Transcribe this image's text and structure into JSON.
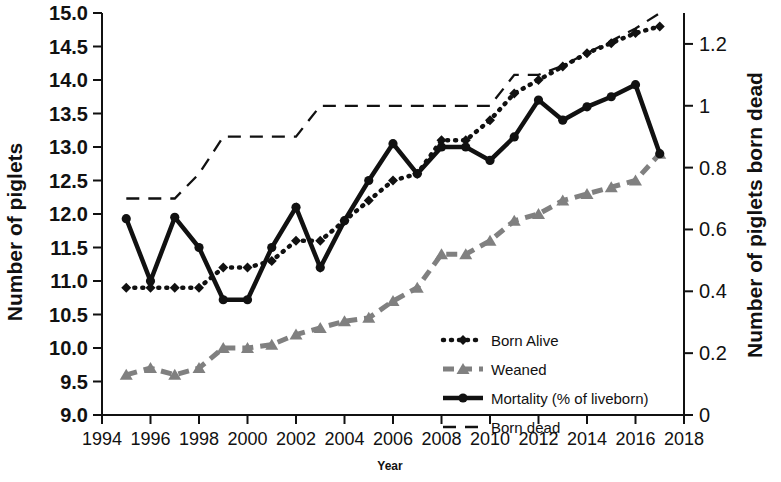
{
  "chart_data": {
    "type": "line",
    "title": "",
    "xlabel": "Year",
    "ylabel": "Number of piglets",
    "ylabel_right": "Number of piglets born dead",
    "x": [
      1995,
      1996,
      1997,
      1998,
      1999,
      2000,
      2001,
      2002,
      2003,
      2004,
      2005,
      2006,
      2007,
      2008,
      2009,
      2010,
      2011,
      2012,
      2013,
      2014,
      2015,
      2016,
      2017
    ],
    "xlim": [
      1994,
      2018
    ],
    "xticks": [
      "1994",
      "1996",
      "1998",
      "2000",
      "2002",
      "2004",
      "2006",
      "2008",
      "2010",
      "2012",
      "2014",
      "2016",
      "2018"
    ],
    "xtick_values": [
      1994,
      1996,
      1998,
      2000,
      2002,
      2004,
      2006,
      2008,
      2010,
      2012,
      2014,
      2016,
      2018
    ],
    "ylim": [
      9.0,
      15.0
    ],
    "yticks": [
      "9.0",
      "9.5",
      "10.0",
      "10.5",
      "11.0",
      "11.5",
      "12.0",
      "12.5",
      "13.0",
      "13.5",
      "14.0",
      "14.5",
      "15.0"
    ],
    "ytick_values": [
      9.0,
      9.5,
      10.0,
      10.5,
      11.0,
      11.5,
      12.0,
      12.5,
      13.0,
      13.5,
      14.0,
      14.5,
      15.0
    ],
    "ylim_right": [
      0,
      1.3
    ],
    "yticks_right": [
      "0",
      "0.2",
      "0.4",
      "0.6",
      "0.8",
      "1",
      "1.2"
    ],
    "ytick_values_right": [
      0,
      0.2,
      0.4,
      0.6,
      0.8,
      1.0,
      1.2
    ],
    "grid": false,
    "legend_position": "center-right",
    "series": [
      {
        "name": "Born Alive",
        "axis": "left",
        "style": "dotted",
        "color": "#111111",
        "marker": "diamond",
        "values": [
          10.9,
          10.9,
          10.9,
          10.9,
          11.2,
          11.2,
          11.3,
          11.6,
          11.6,
          11.9,
          12.2,
          12.5,
          12.6,
          13.1,
          13.1,
          13.4,
          13.8,
          14.0,
          14.2,
          14.4,
          14.55,
          14.7,
          14.8
        ]
      },
      {
        "name": "Weaned",
        "axis": "left",
        "style": "dashed",
        "color": "#808080",
        "marker": "triangle",
        "values": [
          9.6,
          9.7,
          9.6,
          9.7,
          10.0,
          10.0,
          10.05,
          10.2,
          10.3,
          10.4,
          10.45,
          10.7,
          10.9,
          11.4,
          11.4,
          11.6,
          11.9,
          12.0,
          12.2,
          12.3,
          12.4,
          12.5,
          12.9
        ]
      },
      {
        "name": "Mortality (% of liveborn)",
        "axis": "left",
        "style": "solid",
        "color": "#111111",
        "marker": "circle",
        "values": [
          11.93,
          11.0,
          11.95,
          11.5,
          10.72,
          10.72,
          11.5,
          12.1,
          11.2,
          11.9,
          12.5,
          13.05,
          12.6,
          13.0,
          13.0,
          12.8,
          13.15,
          13.7,
          13.4,
          13.6,
          13.75,
          13.93,
          12.9
        ]
      },
      {
        "name": "Born dead",
        "axis": "right",
        "style": "longdash",
        "color": "#111111",
        "marker": "none",
        "values": [
          0.7,
          0.7,
          0.7,
          0.78,
          0.9,
          0.9,
          0.9,
          0.9,
          1.0,
          1.0,
          1.0,
          1.0,
          1.0,
          1.0,
          1.0,
          1.0,
          1.1,
          1.1,
          1.13,
          1.17,
          1.21,
          1.25,
          1.3
        ]
      }
    ]
  },
  "legend": {
    "items": [
      {
        "label": "Born Alive"
      },
      {
        "label": "Weaned"
      },
      {
        "label": "Mortality (% of liveborn)"
      },
      {
        "label": "Born dead"
      }
    ]
  }
}
